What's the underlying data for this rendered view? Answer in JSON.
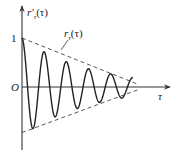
{
  "chart_data": {
    "type": "line",
    "title": "",
    "xlabel": "τ",
    "ylabel": "r'τ(τ)",
    "ylabel_main": "r'",
    "ylabel_sub": "τ",
    "ylabel_arg": "(τ)",
    "origin_label": "O",
    "y_tick_labels": [
      "1"
    ],
    "y_ticks": [
      1
    ],
    "xlim": [
      0,
      5.2
    ],
    "ylim": [
      -1.1,
      1.25
    ],
    "grid": false,
    "series": [
      {
        "name": "r'τ(τ)",
        "style": "solid",
        "function": "exp(-0.33 τ) · cos(2π τ)",
        "decay": 0.33,
        "frequency": 1.0,
        "tau_range": [
          0,
          5.0
        ]
      },
      {
        "name": "rτ(τ)",
        "style": "dashed",
        "function": "± envelope, linear taper",
        "upper_start": 1.0,
        "upper_end": 0.06,
        "lower_start": -0.93,
        "lower_end": -0.06,
        "tau_range": [
          0,
          5.2
        ]
      }
    ],
    "annotations": [
      {
        "text": "rτ(τ)",
        "main": "r",
        "sub": "τ",
        "arg": "(τ)",
        "points_to": "upper envelope"
      }
    ]
  }
}
